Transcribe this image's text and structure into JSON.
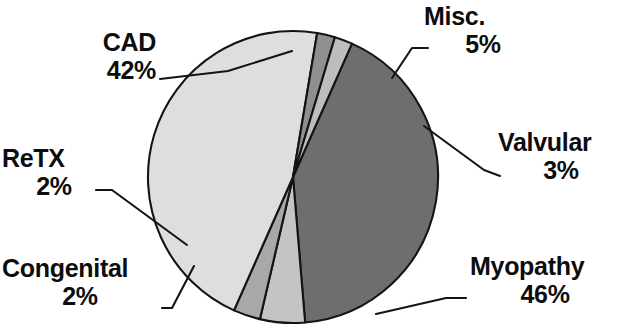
{
  "chart_data": {
    "type": "pie",
    "title": "",
    "subtitle": "",
    "xlabel": "",
    "ylabel": "",
    "legend_position": "none",
    "grid": false,
    "value_unit": "%",
    "total": 100,
    "categories": [
      "CAD",
      "Misc.",
      "Valvular",
      "Myopathy",
      "Congenital",
      "ReTX"
    ],
    "values": [
      42,
      5,
      3,
      46,
      2,
      2
    ],
    "slices": [
      {
        "name": "CAD",
        "value": 42,
        "value_label": "42%",
        "color": "#6e6e6e",
        "start_angle": 294,
        "end_angle": 445.2
      },
      {
        "name": "Misc.",
        "value": 5,
        "value_label": "5%",
        "color": "#c4c4c4",
        "start_angle": 445.2,
        "end_angle": 463.2
      },
      {
        "name": "Valvular",
        "value": 3,
        "value_label": "3%",
        "color": "#a8a8a8",
        "start_angle": 463.2,
        "end_angle": 474.0
      },
      {
        "name": "Myopathy",
        "value": 46,
        "value_label": "46%",
        "color": "#dedede",
        "start_angle": 474.0,
        "end_angle": 639.6
      },
      {
        "name": "Congenital",
        "value": 2,
        "value_label": "2%",
        "color": "#8f8f8f",
        "start_angle": 639.6,
        "end_angle": 646.8
      },
      {
        "name": "ReTX",
        "value": 2,
        "value_label": "2%",
        "color": "#bdbdbd",
        "start_angle": 646.8,
        "end_angle": 654.0
      }
    ],
    "stroke_color": "#141414",
    "background_color": "#ffffff"
  },
  "labels": {
    "cad": {
      "name": "CAD",
      "pct": "42%"
    },
    "misc": {
      "name": "Misc.",
      "pct": "5%"
    },
    "valvular": {
      "name": "Valvular",
      "pct": "3%"
    },
    "myopathy": {
      "name": "Myopathy",
      "pct": "46%"
    },
    "retx": {
      "name": "ReTX",
      "pct": "2%"
    },
    "congenital": {
      "name": "Congenital",
      "pct": "2%"
    }
  }
}
